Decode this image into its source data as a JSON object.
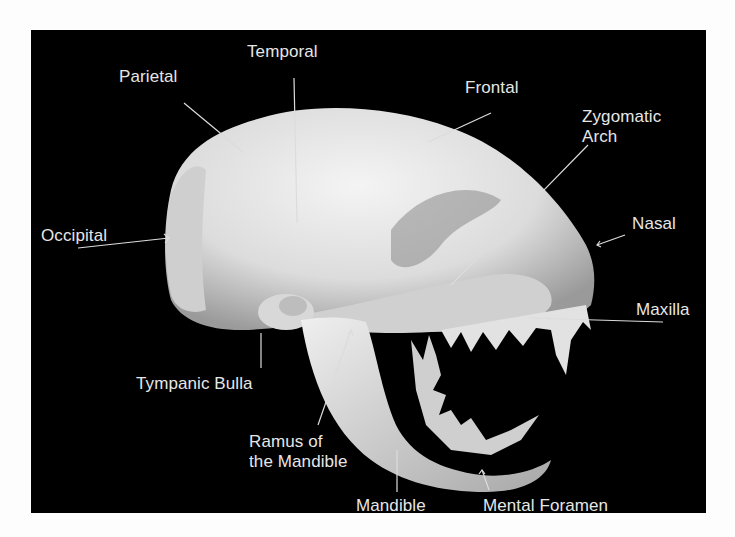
{
  "figure": {
    "background_color": "#000000",
    "label_color": "#e6e6e6",
    "bone_color": "#e4e4e4"
  },
  "labels": [
    {
      "id": "temporal",
      "text": "Temporal",
      "x": 216,
      "y": 12
    },
    {
      "id": "parietal",
      "text": "Parietal",
      "x": 88,
      "y": 37
    },
    {
      "id": "frontal",
      "text": "Frontal",
      "x": 434,
      "y": 48
    },
    {
      "id": "zygomatic-arch",
      "text": "Zygomatic\nArch",
      "x": 551,
      "y": 77
    },
    {
      "id": "occipital",
      "text": "Occipital",
      "x": 10,
      "y": 196
    },
    {
      "id": "nasal",
      "text": "Nasal",
      "x": 601,
      "y": 184
    },
    {
      "id": "maxilla",
      "text": "Maxilla",
      "x": 605,
      "y": 270
    },
    {
      "id": "tympanic-bulla",
      "text": "Tympanic Bulla",
      "x": 105,
      "y": 344
    },
    {
      "id": "ramus-of-the-mandible",
      "text": "Ramus of\nthe Mandible",
      "x": 218,
      "y": 402
    },
    {
      "id": "mandible",
      "text": "Mandible",
      "x": 325,
      "y": 466
    },
    {
      "id": "mental-foramen",
      "text": "Mental Foramen",
      "x": 452,
      "y": 466
    }
  ]
}
